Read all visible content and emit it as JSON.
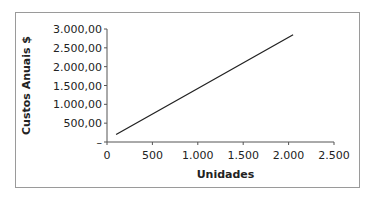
{
  "chart_data": {
    "type": "line",
    "title": "",
    "xlabel": "Unidades",
    "ylabel": "Custos Anuais $",
    "xlim": [
      0,
      2500
    ],
    "ylim": [
      0,
      3000
    ],
    "x_ticks": [
      0,
      500,
      1000,
      1500,
      2000,
      2500
    ],
    "x_tick_labels": [
      "0",
      "500",
      "1.000",
      "1.500",
      "2.000",
      "2.500"
    ],
    "y_ticks": [
      0,
      500,
      1000,
      1500,
      2000,
      2500,
      3000
    ],
    "y_tick_labels": [
      "–",
      "500,00",
      "1.000,00",
      "1.500,00",
      "2.000,00",
      "2.500,00",
      "3.000,00"
    ],
    "grid": false,
    "legend": "none",
    "series": [
      {
        "name": "Custos Anuais",
        "color": "#222222",
        "x": [
          100,
          1000,
          2050
        ],
        "y": [
          200,
          1420,
          2850
        ]
      }
    ]
  }
}
